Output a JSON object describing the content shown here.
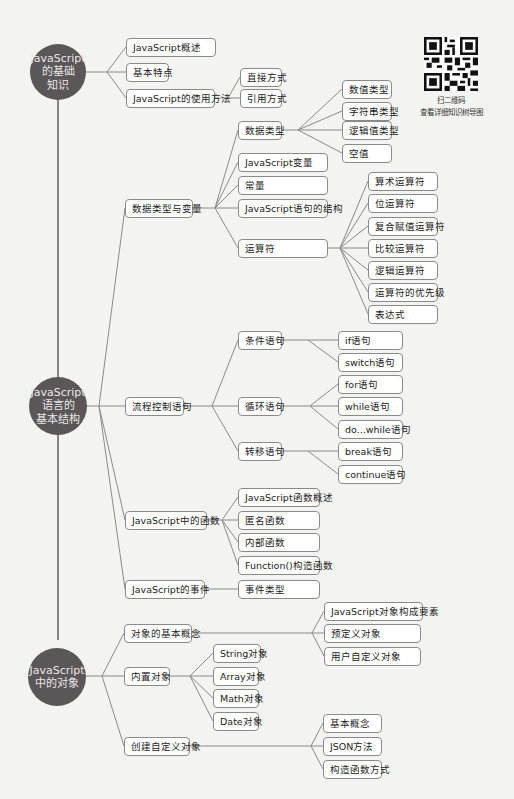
{
  "roots": [
    {
      "lines": [
        "JavaScript",
        "的基础",
        "知识"
      ]
    },
    {
      "lines": [
        "JavaScript",
        "语言的",
        "基本结构"
      ]
    },
    {
      "lines": [
        "JavaScript",
        "中的对象"
      ]
    }
  ],
  "nodes": {
    "js_overview": "JavaScript概述",
    "basic_features": "基本特点",
    "usage_methods": "JavaScript的使用方法",
    "direct_way": "直接方式",
    "reference_way": "引用方式",
    "data_types_vars": "数据类型与变量",
    "data_types": "数据类型",
    "number_type": "数值类型",
    "string_type": "字符串类型",
    "boolean_type": "逻辑值类型",
    "null_value": "空值",
    "js_variables": "JavaScript变量",
    "constants": "常量",
    "statement_structure": "JavaScript语句的结构",
    "operators": "运算符",
    "arithmetic_ops": "算术运算符",
    "bitwise_ops": "位运算符",
    "compound_assign_ops": "复合赋值运算符",
    "comparison_ops": "比较运算符",
    "logical_ops": "逻辑运算符",
    "op_precedence": "运算符的优先级",
    "expressions": "表达式",
    "flow_control": "流程控制语句",
    "conditional": "条件语句",
    "if_stmt": "if语句",
    "switch_stmt": "switch语句",
    "loop": "循环语句",
    "for_stmt": "for语句",
    "while_stmt": "while语句",
    "do_while_stmt": "do...while语句",
    "jump": "转移语句",
    "break_stmt": "break语句",
    "continue_stmt": "continue语句",
    "js_functions": "JavaScript中的函数",
    "func_overview": "JavaScript函数概述",
    "anonymous_func": "匿名函数",
    "inner_func": "内部函数",
    "function_ctor": "Function()构造函数",
    "js_events": "JavaScript的事件",
    "event_types": "事件类型",
    "object_concepts": "对象的基本概念",
    "object_elements": "JavaScript对象构成要素",
    "predefined_objects": "预定义对象",
    "user_defined_objects": "用户自定义对象",
    "builtin_objects": "内置对象",
    "string_obj": "String对象",
    "array_obj": "Array对象",
    "math_obj": "Math对象",
    "date_obj": "Date对象",
    "create_custom_obj": "创建自定义对象",
    "basic_concepts": "基本概念",
    "json_method": "JSON方法",
    "ctor_func_way": "构造函数方式"
  },
  "qr": {
    "caption_line1": "扫二维码",
    "caption_line2": "查看详细知识树导图"
  },
  "colors": {
    "root_fill": "#5b5657",
    "root_text": "#e9e7e7",
    "line": "#8a8a8a",
    "node_border": "#8a8a8a",
    "background": "#f3f3f1"
  }
}
